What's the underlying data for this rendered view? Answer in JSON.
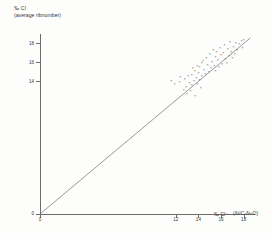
{
  "figure": {
    "y_axis_label_line1": "‰ Cl",
    "y_axis_label_line2": "(average ribnumber)",
    "x_axis_caption": "‰ Cl⁻",
    "x_axis_caption_note": "(δ¹³C-δ¹⁸O)"
  },
  "chart_data": {
    "type": "scatter",
    "title": "",
    "xlabel": "‰ Cl⁻ (δ¹³C-δ¹⁸O)",
    "ylabel": "‰ Cl (average ribnumber)",
    "xlim": [
      0,
      19
    ],
    "ylim": [
      0,
      19
    ],
    "grid": false,
    "legend": "none",
    "marker": "x",
    "marker_color": "#444444",
    "line_color": "#6e6e6e",
    "axis_color": "#6e6e6e",
    "xticks": [
      0,
      12,
      14,
      16,
      18
    ],
    "xticklabels": [
      "0",
      "12",
      "14",
      "16",
      "18"
    ],
    "yticks": [
      0,
      14,
      16,
      18
    ],
    "yticklabels": [
      "0",
      "14",
      "16",
      "18"
    ],
    "reference_line": {
      "label": "1:1 line",
      "x": [
        0,
        18.6
      ],
      "y": [
        0,
        18.6
      ]
    },
    "x": [
      11.6,
      11.9,
      12.3,
      12.4,
      12.7,
      12.8,
      12.9,
      13.0,
      13.1,
      13.2,
      13.3,
      13.4,
      13.4,
      13.5,
      13.6,
      13.7,
      13.7,
      13.8,
      13.9,
      13.9,
      14.0,
      14.1,
      14.1,
      14.2,
      14.3,
      14.3,
      14.4,
      14.5,
      14.6,
      14.7,
      14.8,
      14.9,
      15.0,
      15.1,
      15.2,
      15.3,
      15.4,
      15.5,
      15.5,
      15.6,
      15.7,
      15.8,
      15.9,
      16.0,
      16.1,
      16.2,
      16.3,
      16.4,
      16.5,
      16.6,
      16.7,
      16.8,
      16.9,
      17.0,
      17.1,
      17.2,
      17.3,
      17.4,
      17.6,
      17.8,
      17.9,
      18.0
    ],
    "y": [
      14.0,
      13.6,
      13.9,
      14.4,
      13.0,
      14.2,
      13.3,
      12.6,
      14.5,
      13.8,
      12.9,
      14.6,
      13.5,
      15.3,
      14.0,
      15.0,
      12.4,
      14.3,
      15.6,
      13.7,
      14.8,
      14.1,
      15.4,
      13.2,
      15.9,
      14.5,
      16.1,
      15.1,
      14.7,
      16.4,
      15.7,
      14.9,
      16.8,
      15.3,
      16.0,
      17.2,
      15.6,
      16.5,
      15.0,
      17.0,
      16.2,
      15.4,
      17.5,
      16.7,
      15.8,
      16.9,
      17.8,
      16.3,
      15.9,
      17.3,
      16.6,
      18.1,
      17.0,
      16.4,
      17.6,
      16.8,
      18.0,
      17.2,
      17.9,
      18.2,
      17.5,
      18.3
    ]
  }
}
